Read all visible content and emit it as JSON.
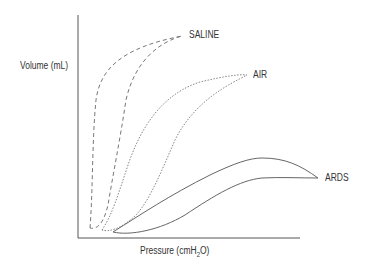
{
  "diagram": {
    "y_axis_label": "Volume (mL)",
    "x_axis_label_main": "Pressure (cmH",
    "x_axis_label_sub": "2",
    "x_axis_label_end": "O)",
    "curves": [
      {
        "name": "SALINE",
        "line_style": "dashed"
      },
      {
        "name": "AIR",
        "line_style": "dotted"
      },
      {
        "name": "ARDS",
        "line_style": "solid"
      }
    ]
  }
}
